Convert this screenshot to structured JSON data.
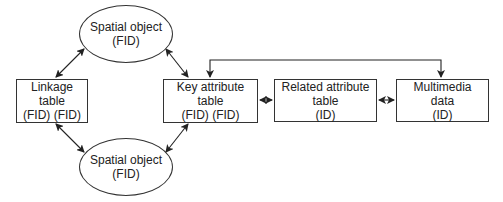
{
  "diagram": {
    "nodes": [
      {
        "id": "spatial_top",
        "shape": "ellipse",
        "lines": [
          "Spatial object",
          "(FID)"
        ]
      },
      {
        "id": "linkage",
        "shape": "box",
        "lines": [
          "Linkage",
          "table",
          "(FID) (FID)"
        ]
      },
      {
        "id": "key_attr",
        "shape": "box",
        "lines": [
          "Key attribute",
          "table",
          "(FID) (FID)"
        ]
      },
      {
        "id": "spatial_bottom",
        "shape": "ellipse",
        "lines": [
          "Spatial object",
          "(FID)"
        ]
      },
      {
        "id": "related",
        "shape": "box",
        "lines": [
          "Related attribute",
          "table",
          "(ID)"
        ]
      },
      {
        "id": "multimedia",
        "shape": "box",
        "lines": [
          "Multimedia",
          "data",
          "(ID)"
        ]
      }
    ],
    "edges": [
      {
        "from": "spatial_top",
        "to": "linkage",
        "type": "bidirectional"
      },
      {
        "from": "spatial_top",
        "to": "key_attr",
        "type": "bidirectional"
      },
      {
        "from": "spatial_bottom",
        "to": "linkage",
        "type": "bidirectional"
      },
      {
        "from": "spatial_bottom",
        "to": "key_attr",
        "type": "bidirectional"
      },
      {
        "from": "key_attr",
        "to": "related",
        "type": "bidirectional"
      },
      {
        "from": "related",
        "to": "multimedia",
        "type": "bidirectional"
      },
      {
        "from": "key_attr",
        "to": "multimedia",
        "type": "bidirectional-elbow-over-top"
      }
    ]
  }
}
